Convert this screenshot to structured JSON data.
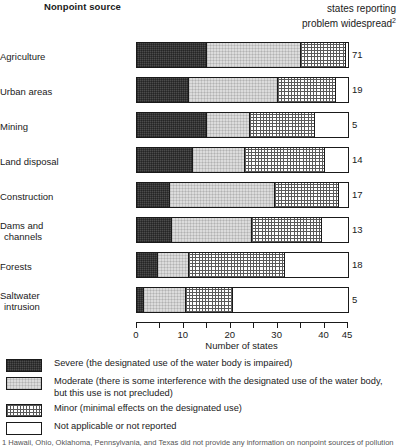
{
  "header": {
    "left_title_line1": "Nonpoint",
    "left_title_line2": "source",
    "right_line0": "Number of",
    "right_line1": "states reporting",
    "right_line2": "problem widespread",
    "right_superscript": "2"
  },
  "chart_data": {
    "type": "bar",
    "orientation": "horizontal",
    "stacked": true,
    "title": "",
    "xlabel": "Number of states",
    "ylabel": "Nonpoint source",
    "xlim": [
      0,
      45
    ],
    "xticks": [
      0,
      5,
      10,
      15,
      20,
      25,
      30,
      35,
      40,
      45
    ],
    "xtick_labels": [
      "0",
      "",
      "10",
      "",
      "20",
      "",
      "30",
      "",
      "40",
      "45"
    ],
    "grid": false,
    "legend_position": "below",
    "categories": [
      "Agriculture",
      "Urban areas",
      "Mining",
      "Land disposal",
      "Construction",
      "Dams and channels",
      "Forests",
      "Saltwater intrusion"
    ],
    "series": [
      {
        "name": "Severe (the designated use of the water body is impaired)",
        "key": "severe",
        "values": [
          15,
          11,
          15,
          12,
          7,
          7.5,
          4.5,
          1.5
        ]
      },
      {
        "name": "Moderate (there is some interference with the designated use of the water body, but this use is not  precluded)",
        "key": "moderate",
        "values": [
          20,
          19,
          9,
          11,
          22.5,
          17,
          6.5,
          9
        ]
      },
      {
        "name": "Minor (minimal effects on the designated use)",
        "key": "minor",
        "values": [
          9.5,
          12.5,
          14,
          17,
          13.5,
          15,
          20.5,
          10
        ]
      },
      {
        "name": "Not applicable or not reported",
        "key": "na",
        "values": [
          0.5,
          2.5,
          7,
          5,
          2,
          5.5,
          13.5,
          24.5
        ]
      }
    ],
    "states_reporting_widespread": [
      71,
      19,
      5,
      14,
      17,
      13,
      18,
      5
    ]
  },
  "rows": [
    {
      "label_line1": "Agriculture",
      "label_line2": "",
      "value": "71"
    },
    {
      "label_line1": "Urban areas",
      "label_line2": "",
      "value": "19"
    },
    {
      "label_line1": "Mining",
      "label_line2": "",
      "value": "5"
    },
    {
      "label_line1": "Land disposal",
      "label_line2": "",
      "value": "14"
    },
    {
      "label_line1": "Construction",
      "label_line2": "",
      "value": "17"
    },
    {
      "label_line1": "Dams and",
      "label_line2": "channels",
      "value": "13"
    },
    {
      "label_line1": "Forests",
      "label_line2": "",
      "value": "18"
    },
    {
      "label_line1": "Saltwater",
      "label_line2": "intrusion",
      "value": "5"
    }
  ],
  "axis": {
    "labels": [
      "0",
      "10",
      "20",
      "30",
      "40",
      "45"
    ],
    "label_values": [
      0,
      10,
      20,
      30,
      40,
      45
    ],
    "title": "Number of states"
  },
  "legend": {
    "items": [
      {
        "swatch": "severe",
        "text": "Severe (the designated use of the water body is impaired)"
      },
      {
        "swatch": "moderate",
        "text": "Moderate (there is some interference with the designated use of the water body, but this use is not  precluded)"
      },
      {
        "swatch": "minor",
        "text": "Minor (minimal effects on the designated use)"
      },
      {
        "swatch": "na",
        "text": "Not applicable or not reported"
      }
    ]
  },
  "footnote": "1 Hawaii, Ohio, Oklahoma, Pennsylvania, and Texas did not provide any information on nonpoint sources of pollution"
}
